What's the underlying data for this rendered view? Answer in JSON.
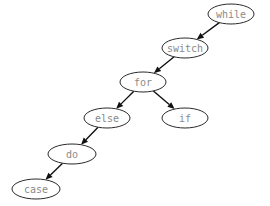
{
  "diagram": {
    "type": "binary-tree",
    "nodes": [
      {
        "id": "while",
        "label": "while",
        "cx": 231,
        "cy": 14,
        "rx": 23,
        "ry": 10
      },
      {
        "id": "switch",
        "label": "switch",
        "cx": 185,
        "cy": 48,
        "rx": 23,
        "ry": 10
      },
      {
        "id": "for",
        "label": "for",
        "cx": 143,
        "cy": 82,
        "rx": 23,
        "ry": 10
      },
      {
        "id": "else",
        "label": "else",
        "cx": 107,
        "cy": 118,
        "rx": 23,
        "ry": 10
      },
      {
        "id": "if",
        "label": "if",
        "cx": 185,
        "cy": 118,
        "rx": 23,
        "ry": 10
      },
      {
        "id": "do",
        "label": "do",
        "cx": 72,
        "cy": 154,
        "rx": 24,
        "ry": 10
      },
      {
        "id": "case",
        "label": "case",
        "cx": 36,
        "cy": 189,
        "rx": 24,
        "ry": 10
      }
    ],
    "edges": [
      {
        "from": "while",
        "to": "switch"
      },
      {
        "from": "switch",
        "to": "for"
      },
      {
        "from": "for",
        "to": "else"
      },
      {
        "from": "for",
        "to": "if"
      },
      {
        "from": "else",
        "to": "do"
      },
      {
        "from": "do",
        "to": "case"
      }
    ]
  }
}
